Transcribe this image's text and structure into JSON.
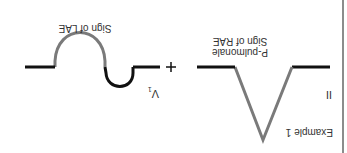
{
  "figure": {
    "title": "Example 1",
    "orientation": "rotated-180",
    "lead_left": "II",
    "lead_right_main": "V",
    "lead_right_sub": "1",
    "operator": "+",
    "waveforms": [
      {
        "name": "p-pulmonale",
        "caption_line1": "P-pulmonale",
        "caption_line2": "Sign of RAE",
        "shape": "tall peaked P wave"
      },
      {
        "name": "lae-biphasic",
        "caption_line1": "Sign of LAE",
        "shape": "biphasic P wave with deep terminal negative component"
      }
    ],
    "colors": {
      "baseline": "#111111",
      "wave_gray": "#7a7a7a",
      "border": "#666666",
      "text": "#333333"
    }
  }
}
